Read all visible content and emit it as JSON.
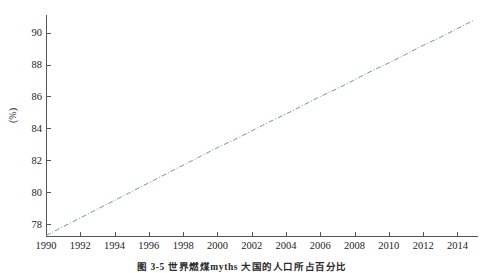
{
  "figure": {
    "caption": "图 3-5  世界燃煤myths 大国的人口所占百分比",
    "background_color": "#ffffff"
  },
  "chart_data": {
    "type": "line",
    "title": "",
    "xlabel": "",
    "ylabel": "(%)",
    "xlim": [
      1990,
      2015.2
    ],
    "ylim": [
      77.27,
      91.1
    ],
    "grid": false,
    "legend": "none",
    "line_color": "#6b7fb5",
    "line_style": "dash-dot",
    "line_width": 0.9,
    "xticks": [
      1990,
      1992,
      1994,
      1996,
      1998,
      2000,
      2002,
      2004,
      2006,
      2008,
      2010,
      2012,
      2014
    ],
    "xtick_labels": [
      "1990",
      "1992",
      "1994",
      "1996",
      "1998",
      "2000",
      "2002",
      "2004",
      "2006",
      "2008",
      "2010",
      "2012",
      "2014"
    ],
    "yticks": [
      78,
      80,
      82,
      84,
      86,
      88,
      90
    ],
    "ytick_labels": [
      "78",
      "80",
      "82",
      "84",
      "86",
      "88",
      "90"
    ],
    "series": [
      {
        "name": "percentage",
        "x": [
          1990,
          1991,
          1992,
          1993,
          1994,
          1995,
          1996,
          1997,
          1998,
          1999,
          2000,
          2001,
          2002,
          2003,
          2004,
          2005,
          2006,
          2007,
          2008,
          2009,
          2010,
          2011,
          2012,
          2013,
          2014,
          2015
        ],
        "values": [
          77.3,
          77.85,
          78.4,
          78.95,
          79.5,
          80.05,
          80.6,
          81.15,
          81.7,
          82.25,
          82.8,
          83.3,
          83.85,
          84.4,
          84.9,
          85.45,
          86.0,
          86.5,
          87.05,
          87.6,
          88.1,
          88.65,
          89.2,
          89.7,
          90.25,
          90.8
        ]
      }
    ]
  }
}
